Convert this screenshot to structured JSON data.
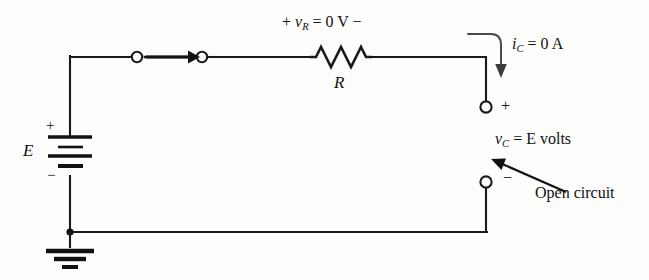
{
  "figure": {
    "background_color": "#fdfdfc",
    "line_color": "#1a1a1a",
    "labels": {
      "resistor_voltage_plus": "+",
      "resistor_voltage_symbol": "v",
      "resistor_voltage_subscript": "R",
      "resistor_voltage_equals": "= 0 V",
      "resistor_voltage_minus": "−",
      "resistor_voltage_full": "+ vR = 0 V −",
      "resistor_name": "R",
      "current_symbol": "i",
      "current_subscript": "C",
      "current_equals": "= 0 A",
      "current_full": "iC = 0 A",
      "capacitor_voltage_symbol": "v",
      "capacitor_voltage_subscript": "C",
      "capacitor_voltage_equals": "= E volts",
      "capacitor_voltage_full": "vC = E volts",
      "annotation": "Open circuit",
      "source_name": "E",
      "source_plus": "+",
      "source_minus": "−",
      "terminal_plus": "+",
      "terminal_minus": "−"
    },
    "components": [
      {
        "name": "voltage-source",
        "symbol": "E",
        "type": "battery",
        "polarity_top": "+",
        "polarity_bottom": "−"
      },
      {
        "name": "resistor",
        "symbol": "R",
        "type": "resistor",
        "voltage": "0 V"
      },
      {
        "name": "switch-node-left",
        "type": "terminal-node"
      },
      {
        "name": "switch-node-right",
        "type": "terminal-node"
      },
      {
        "name": "current-direction-arrow",
        "type": "arrow"
      },
      {
        "name": "open-terminal-top",
        "type": "terminal-node",
        "polarity": "+"
      },
      {
        "name": "open-terminal-bottom",
        "type": "terminal-node",
        "polarity": "−"
      },
      {
        "name": "ground",
        "type": "earth-ground"
      }
    ],
    "values": {
      "resistor_voltage": "0 V",
      "capacitor_current": "0 A",
      "capacitor_voltage": "E volts"
    }
  }
}
